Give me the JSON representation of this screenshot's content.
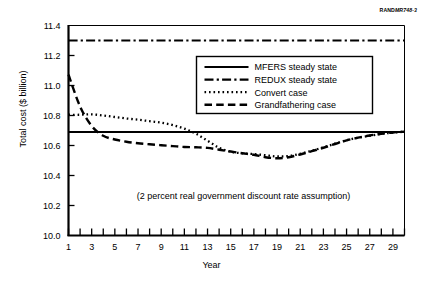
{
  "source_tag": {
    "prefix": "RAND",
    "italic": "MR748-3"
  },
  "axes": {
    "ylabel": "Total cost ($ billion)",
    "xlabel": "Year",
    "yticks": [
      "11.4",
      "11.2",
      "11.0",
      "10.8",
      "10.6",
      "10.4",
      "10.2",
      "10.0"
    ],
    "xticks": [
      "1",
      "3",
      "5",
      "7",
      "9",
      "11",
      "13",
      "15",
      "17",
      "19",
      "21",
      "23",
      "25",
      "27",
      "29"
    ]
  },
  "annotation": "(2 percent real government discount rate assumption)",
  "legend": {
    "items": [
      {
        "label": "MFERS steady state",
        "style": "solid"
      },
      {
        "label": "REDUX steady state",
        "style": "dashdot"
      },
      {
        "label": "Convert case",
        "style": "dotted"
      },
      {
        "label": "Grandfathering case",
        "style": "dashed"
      }
    ]
  },
  "colors": {
    "line": "#000000",
    "background": "#ffffff",
    "axis": "#000000"
  },
  "chart_data": {
    "type": "line",
    "title": "",
    "xlabel": "Year",
    "ylabel": "Total cost ($ billion)",
    "xlim": [
      1,
      30
    ],
    "ylim": [
      10.0,
      11.4
    ],
    "ytick_step": 0.2,
    "xtick_step": 1,
    "xtick_label_step": 2,
    "grid": false,
    "legend_position": "upper-right-inside",
    "annotations": [
      "(2 percent real government discount rate assumption)"
    ],
    "x": [
      1,
      2,
      3,
      4,
      5,
      6,
      7,
      8,
      9,
      10,
      11,
      12,
      13,
      14,
      15,
      16,
      17,
      18,
      19,
      20,
      21,
      22,
      23,
      24,
      25,
      26,
      27,
      28,
      29,
      30
    ],
    "series": [
      {
        "name": "MFERS steady state",
        "style": "solid",
        "values": [
          10.69,
          10.69,
          10.69,
          10.69,
          10.69,
          10.69,
          10.69,
          10.69,
          10.69,
          10.69,
          10.69,
          10.69,
          10.69,
          10.69,
          10.69,
          10.69,
          10.69,
          10.69,
          10.69,
          10.69,
          10.69,
          10.69,
          10.69,
          10.69,
          10.69,
          10.69,
          10.69,
          10.69,
          10.69,
          10.69
        ]
      },
      {
        "name": "REDUX steady state",
        "style": "dashdot",
        "values": [
          11.3,
          11.3,
          11.3,
          11.3,
          11.3,
          11.3,
          11.3,
          11.3,
          11.3,
          11.3,
          11.3,
          11.3,
          11.3,
          11.3,
          11.3,
          11.3,
          11.3,
          11.3,
          11.3,
          11.3,
          11.3,
          11.3,
          11.3,
          11.3,
          11.3,
          11.3,
          11.3,
          11.3,
          11.3,
          11.3
        ]
      },
      {
        "name": "Convert case",
        "style": "dotted",
        "values": [
          10.805,
          10.805,
          10.808,
          10.8,
          10.79,
          10.78,
          10.772,
          10.762,
          10.752,
          10.736,
          10.712,
          10.678,
          10.632,
          10.585,
          10.558,
          10.548,
          10.543,
          10.535,
          10.527,
          10.53,
          10.545,
          10.565,
          10.588,
          10.612,
          10.635,
          10.652,
          10.665,
          10.678,
          10.686,
          10.692
        ]
      },
      {
        "name": "Grandfathering case",
        "style": "dashed",
        "values": [
          11.072,
          10.86,
          10.73,
          10.665,
          10.64,
          10.625,
          10.615,
          10.608,
          10.602,
          10.596,
          10.59,
          10.588,
          10.584,
          10.572,
          10.56,
          10.548,
          10.538,
          10.522,
          10.515,
          10.522,
          10.54,
          10.562,
          10.585,
          10.61,
          10.634,
          10.652,
          10.667,
          10.678,
          10.687,
          10.692
        ]
      }
    ]
  }
}
